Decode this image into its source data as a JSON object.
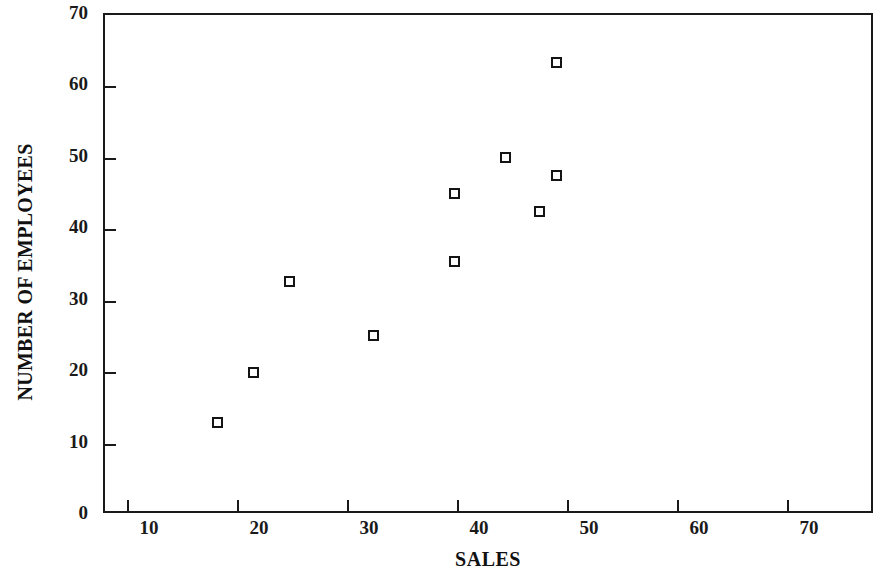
{
  "chart_data": {
    "type": "scatter",
    "title": "",
    "xlabel": "SALES",
    "ylabel": "NUMBER OF EMPLOYEES",
    "xlim": [
      8,
      78
    ],
    "ylim": [
      0,
      70
    ],
    "xticks": [
      10,
      20,
      30,
      40,
      50,
      60,
      70
    ],
    "xtick_labels": [
      "10",
      "20",
      "30",
      "40",
      "50",
      "60",
      "70"
    ],
    "yticks": [
      0,
      10,
      20,
      30,
      40,
      50,
      60,
      70
    ],
    "ytick_labels": [
      "0",
      "10",
      "20",
      "30",
      "40",
      "50",
      "60",
      "70"
    ],
    "grid": false,
    "legend": false,
    "marker": "open-square",
    "marker_color": "#141414",
    "points": [
      {
        "x": 18.2,
        "y": 13.0
      },
      {
        "x": 21.5,
        "y": 20.0
      },
      {
        "x": 24.8,
        "y": 32.7
      },
      {
        "x": 32.4,
        "y": 25.2
      },
      {
        "x": 39.8,
        "y": 35.5
      },
      {
        "x": 39.8,
        "y": 45.0
      },
      {
        "x": 44.4,
        "y": 50.0
      },
      {
        "x": 47.5,
        "y": 42.5
      },
      {
        "x": 49.0,
        "y": 47.5
      },
      {
        "x": 49.0,
        "y": 63.3
      }
    ],
    "x_values": [
      18.2,
      21.5,
      24.8,
      32.4,
      39.8,
      39.8,
      44.4,
      47.5,
      49.0,
      49.0
    ],
    "y_values": [
      13.0,
      20.0,
      32.7,
      25.2,
      35.5,
      45.0,
      50.0,
      42.5,
      47.5,
      63.3
    ]
  }
}
